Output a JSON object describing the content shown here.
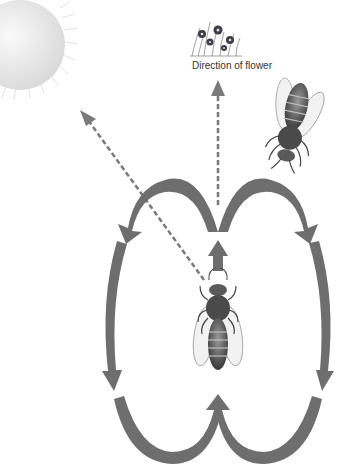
{
  "diagram": {
    "labels": {
      "flower_direction": "Direction of flower"
    },
    "elements": {
      "sun": "sun-icon",
      "flower": "flower-icon",
      "bee_top": "bee-icon",
      "bee_center": "bee-icon"
    },
    "colors": {
      "arrow": "#6e6e6e",
      "dashed": "#7a7a7a",
      "sun": "#e6e6e6",
      "background": "#ffffff"
    }
  }
}
